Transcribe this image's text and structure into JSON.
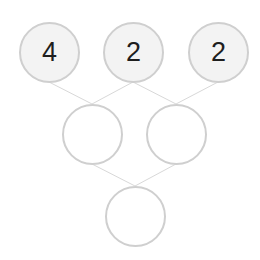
{
  "puzzle": {
    "rows": [
      [
        {
          "value": "4",
          "cx": 49,
          "cy": 52,
          "filled": true
        },
        {
          "value": "2",
          "cx": 133,
          "cy": 52,
          "filled": true
        },
        {
          "value": "2",
          "cx": 218,
          "cy": 52,
          "filled": true
        }
      ],
      [
        {
          "value": "",
          "cx": 92,
          "cy": 134,
          "filled": false
        },
        {
          "value": "",
          "cx": 176,
          "cy": 134,
          "filled": false
        }
      ],
      [
        {
          "value": "",
          "cx": 135,
          "cy": 216,
          "filled": false
        }
      ]
    ],
    "colors": {
      "border": "#cfcfcf",
      "filled_bg": "#f3f3f3",
      "line": "#d8d8d8",
      "text": "#1e1e1e"
    }
  }
}
